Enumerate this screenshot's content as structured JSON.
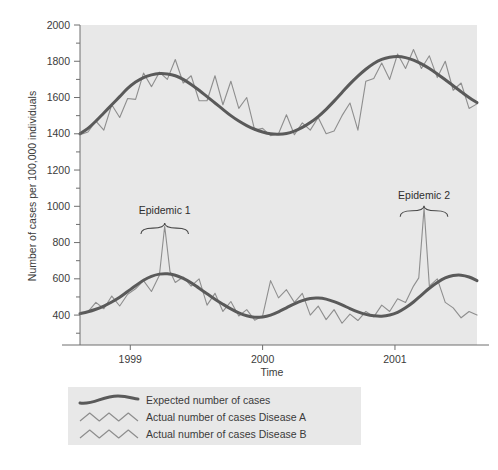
{
  "chart_data": {
    "type": "line",
    "title": "",
    "xlabel": "Time",
    "ylabel": "Number of cases per 100,000 individuals",
    "ylim": [
      235,
      2000
    ],
    "xlim": [
      1998.62,
      2001.62
    ],
    "grid": false,
    "plot_background": "#e8e8e8",
    "ytick_labels": [
      "2000",
      "1800",
      "1600",
      "1400",
      "1200",
      "1000",
      "800",
      "600",
      "400"
    ],
    "ytick_values": [
      2000,
      1800,
      1600,
      1400,
      1200,
      1000,
      800,
      600,
      400
    ],
    "yminor_values": [
      1900,
      1700,
      1500,
      1300,
      1100,
      900,
      700,
      500,
      300
    ],
    "xtick_labels": [
      "1999",
      "2000",
      "2001"
    ],
    "xtick_values": [
      1999,
      2000,
      2001
    ],
    "annotations": [
      {
        "label": "Epidemic 1",
        "x": 1999.26,
        "y": 960,
        "brace_x": 1999.26,
        "brace_y": 880,
        "brace_half_width": 0.18
      },
      {
        "label": "Epidemic 2",
        "x": 2001.22,
        "y": 1040,
        "brace_x": 2001.22,
        "brace_y": 975,
        "brace_half_width": 0.18
      }
    ],
    "series": [
      {
        "name": "Expected number of cases Disease A",
        "role": "expected",
        "color": "#5a5a5a",
        "width": 3.0,
        "x": [
          1998.62,
          1998.68,
          1998.74,
          1998.8,
          1998.86,
          1998.92,
          1998.98,
          1999.04,
          1999.1,
          1999.16,
          1999.22,
          1999.28,
          1999.34,
          1999.4,
          1999.46,
          1999.52,
          1999.58,
          1999.64,
          1999.7,
          1999.76,
          1999.82,
          1999.88,
          1999.94,
          2000.0,
          2000.06,
          2000.12,
          2000.18,
          2000.24,
          2000.3,
          2000.36,
          2000.42,
          2000.48,
          2000.54,
          2000.6,
          2000.66,
          2000.72,
          2000.78,
          2000.84,
          2000.9,
          2000.96,
          2001.02,
          2001.08,
          2001.14,
          2001.2,
          2001.26,
          2001.32,
          2001.38,
          2001.44,
          2001.5,
          2001.56,
          2001.62
        ],
        "y": [
          1400,
          1430,
          1470,
          1515,
          1560,
          1605,
          1650,
          1685,
          1710,
          1725,
          1732,
          1730,
          1720,
          1700,
          1672,
          1640,
          1605,
          1570,
          1535,
          1500,
          1470,
          1445,
          1425,
          1410,
          1400,
          1398,
          1402,
          1415,
          1435,
          1462,
          1495,
          1535,
          1580,
          1628,
          1675,
          1718,
          1756,
          1788,
          1810,
          1822,
          1826,
          1820,
          1806,
          1786,
          1760,
          1730,
          1698,
          1665,
          1632,
          1600,
          1572
        ]
      },
      {
        "name": "Actual number of cases Disease A",
        "role": "actual-a",
        "color": "#8e8e8e",
        "width": 1.1,
        "x": [
          1998.62,
          1998.68,
          1998.74,
          1998.8,
          1998.86,
          1998.92,
          1998.98,
          1999.04,
          1999.1,
          1999.16,
          1999.22,
          1999.28,
          1999.34,
          1999.4,
          1999.46,
          1999.52,
          1999.58,
          1999.64,
          1999.7,
          1999.76,
          1999.82,
          1999.88,
          1999.94,
          2000.0,
          2000.06,
          2000.12,
          2000.18,
          2000.24,
          2000.3,
          2000.36,
          2000.42,
          2000.48,
          2000.54,
          2000.6,
          2000.66,
          2000.72,
          2000.78,
          2000.84,
          2000.9,
          2000.96,
          2001.02,
          2001.08,
          2001.14,
          2001.2,
          2001.26,
          2001.32,
          2001.38,
          2001.44,
          2001.5,
          2001.56,
          2001.62
        ],
        "y": [
          1395,
          1410,
          1470,
          1420,
          1560,
          1490,
          1595,
          1590,
          1735,
          1660,
          1740,
          1700,
          1810,
          1680,
          1720,
          1582,
          1582,
          1720,
          1560,
          1690,
          1540,
          1600,
          1420,
          1430,
          1390,
          1400,
          1505,
          1395,
          1460,
          1420,
          1490,
          1400,
          1415,
          1500,
          1570,
          1420,
          1690,
          1705,
          1790,
          1700,
          1840,
          1760,
          1865,
          1760,
          1830,
          1710,
          1800,
          1640,
          1680,
          1540,
          1565
        ]
      },
      {
        "name": "Expected number of cases Disease B",
        "role": "expected",
        "color": "#5a5a5a",
        "width": 3.0,
        "x": [
          1998.62,
          1998.68,
          1998.74,
          1998.8,
          1998.86,
          1998.92,
          1998.98,
          1999.04,
          1999.1,
          1999.16,
          1999.22,
          1999.28,
          1999.34,
          1999.4,
          1999.46,
          1999.52,
          1999.58,
          1999.64,
          1999.7,
          1999.76,
          1999.82,
          1999.88,
          1999.94,
          2000.0,
          2000.06,
          2000.12,
          2000.18,
          2000.24,
          2000.3,
          2000.36,
          2000.42,
          2000.48,
          2000.54,
          2000.6,
          2000.66,
          2000.72,
          2000.78,
          2000.84,
          2000.9,
          2000.96,
          2001.02,
          2001.08,
          2001.14,
          2001.2,
          2001.26,
          2001.32,
          2001.38,
          2001.44,
          2001.5,
          2001.56,
          2001.62
        ],
        "y": [
          408,
          418,
          432,
          450,
          472,
          498,
          530,
          562,
          592,
          614,
          626,
          628,
          620,
          602,
          578,
          548,
          518,
          488,
          460,
          434,
          412,
          396,
          388,
          390,
          400,
          418,
          440,
          462,
          480,
          492,
          494,
          488,
          474,
          456,
          436,
          418,
          404,
          396,
          394,
          400,
          415,
          440,
          472,
          510,
          548,
          580,
          605,
          618,
          620,
          610,
          590
        ]
      },
      {
        "name": "Actual number of cases Disease B",
        "role": "actual-b",
        "color": "#8e8e8e",
        "width": 1.1,
        "x": [
          1998.62,
          1998.68,
          1998.74,
          1998.8,
          1998.86,
          1998.92,
          1998.98,
          1999.04,
          1999.1,
          1999.16,
          1999.22,
          1999.26,
          1999.3,
          1999.34,
          1999.4,
          1999.46,
          1999.52,
          1999.58,
          1999.64,
          1999.7,
          1999.76,
          1999.82,
          1999.88,
          1999.94,
          2000.0,
          2000.06,
          2000.12,
          2000.18,
          2000.24,
          2000.3,
          2000.36,
          2000.42,
          2000.48,
          2000.54,
          2000.6,
          2000.66,
          2000.72,
          2000.78,
          2000.84,
          2000.9,
          2000.96,
          2001.02,
          2001.08,
          2001.14,
          2001.18,
          2001.22,
          2001.26,
          2001.32,
          2001.38,
          2001.44,
          2001.5,
          2001.56,
          2001.62
        ],
        "y": [
          405,
          418,
          470,
          435,
          505,
          450,
          515,
          545,
          590,
          530,
          620,
          890,
          640,
          580,
          610,
          560,
          600,
          455,
          520,
          420,
          475,
          395,
          430,
          372,
          395,
          590,
          495,
          540,
          470,
          520,
          400,
          450,
          375,
          430,
          355,
          405,
          370,
          420,
          390,
          455,
          420,
          490,
          470,
          560,
          605,
          990,
          560,
          600,
          470,
          440,
          385,
          420,
          400
        ]
      }
    ]
  },
  "legend": {
    "background": "#e8e8e8",
    "items": [
      {
        "label": "Expected number of cases",
        "glyph": "smooth-curve-glyph",
        "color": "#5a5a5a"
      },
      {
        "label": "Actual number of cases Disease A",
        "glyph": "zigzag-curve-glyph",
        "color": "#8e8e8e"
      },
      {
        "label": "Actual number of cases Disease B",
        "glyph": "zigzag-curve-glyph",
        "color": "#8e8e8e"
      }
    ]
  }
}
